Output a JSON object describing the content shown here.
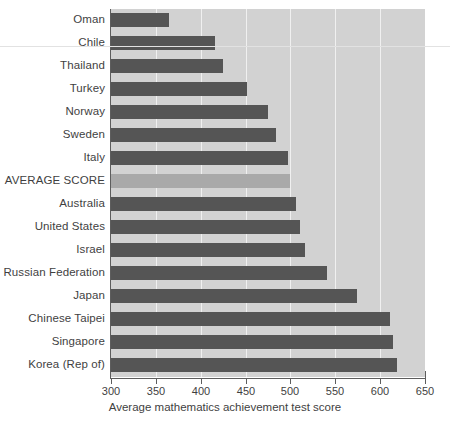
{
  "chart_data": {
    "type": "bar",
    "orientation": "horizontal",
    "title": "",
    "xlabel": "Average mathematics achievement test score",
    "ylabel": "",
    "xlim": [
      300,
      650
    ],
    "xticks": [
      300,
      350,
      400,
      450,
      500,
      550,
      600,
      650
    ],
    "grid": true,
    "legend": false,
    "categories": [
      "Oman",
      "Chile",
      "Thailand",
      "Turkey",
      "Norway",
      "Sweden",
      "Italy",
      "AVERAGE SCORE",
      "Australia",
      "United States",
      "Israel",
      "Russian Federation",
      "Japan",
      "Chinese Taipei",
      "Singapore",
      "Korea (Rep of)"
    ],
    "values": [
      365,
      416,
      425,
      452,
      475,
      484,
      497,
      500,
      506,
      511,
      516,
      541,
      574,
      611,
      614,
      619
    ],
    "highlight_category": "AVERAGE SCORE",
    "colors": {
      "bar": "#555555",
      "highlight_bar": "#a9a9a9",
      "plot_background": "#d2d2d2",
      "gridline": "#f0f0f0",
      "axis": "#5d5d5d",
      "text": "#3f3f3f"
    }
  }
}
